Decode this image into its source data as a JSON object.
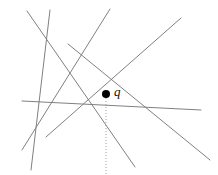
{
  "figure": {
    "name": "line-arrangement-with-query-point",
    "width": 218,
    "height": 175,
    "background_color": "#ffffff",
    "line_color": "#808080",
    "line_width": 1,
    "dotted_line_color": "#a0a0a0",
    "point_color": "#000000"
  },
  "point": {
    "id": "q",
    "label": "q",
    "x": 106,
    "y": 94,
    "radius": 4
  },
  "vertical_ray": {
    "name": "downward-vertical-ray",
    "x": 106,
    "y_start": 98,
    "y_end": 175,
    "style": "dotted"
  },
  "lines": [
    {
      "id": "line-1",
      "x1": 27,
      "y1": 11,
      "x2": 135,
      "y2": 167
    },
    {
      "id": "line-2",
      "x1": 50,
      "y1": 10,
      "x2": 31,
      "y2": 170
    },
    {
      "id": "line-3",
      "x1": 110,
      "y1": 9,
      "x2": 22,
      "y2": 150
    },
    {
      "id": "line-4",
      "x1": 181,
      "y1": 18,
      "x2": 46,
      "y2": 137
    },
    {
      "id": "line-5",
      "x1": 22,
      "y1": 101,
      "x2": 201,
      "y2": 110
    },
    {
      "id": "line-6",
      "x1": 68,
      "y1": 44,
      "x2": 210,
      "y2": 160
    }
  ]
}
